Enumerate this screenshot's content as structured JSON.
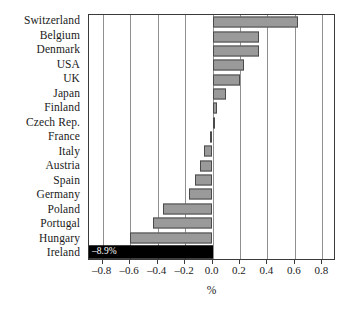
{
  "chart_data": {
    "type": "bar",
    "orientation": "horizontal",
    "title": "",
    "xlabel": "%",
    "ylabel": "",
    "xlim": [
      -0.9,
      0.9
    ],
    "xticks": [
      -0.8,
      -0.6,
      -0.4,
      -0.2,
      0.0,
      0.2,
      0.4,
      0.6,
      0.8
    ],
    "xticklabels": [
      "–0.8",
      "–0.6",
      "–0.4",
      "–0.2",
      "0.0",
      "0.2",
      "0.4",
      "0.6",
      "0.8"
    ],
    "grid": true,
    "grid_axis": "x",
    "legend": null,
    "categories": [
      "Switzerland",
      "Belgium",
      "Denmark",
      "USA",
      "UK",
      "Japan",
      "Finland",
      "Czech Rep.",
      "France",
      "Italy",
      "Austria",
      "Spain",
      "Germany",
      "Poland",
      "Portugal",
      "Hungary",
      "Ireland"
    ],
    "values": [
      0.62,
      0.34,
      0.34,
      0.23,
      0.2,
      0.1,
      0.03,
      0.0,
      -0.02,
      -0.06,
      -0.09,
      -0.13,
      -0.17,
      -0.36,
      -0.43,
      -0.6,
      -8.9
    ],
    "annotations": [
      {
        "category": "Ireland",
        "label": "–8.9%",
        "inside_bar": true
      }
    ],
    "colors": {
      "bar_fill": "#9a9a9a",
      "bar_edge": "#4a4a4a",
      "highlight_fill": "#000000",
      "highlight_label": "#ffffff",
      "gridline": "#8f8f8f",
      "axis": "#3a3a3a",
      "background": "#ffffff"
    },
    "notes": {
      "clipped_bar": "Ireland (–8.9%) extends beyond the axis range and is drawn full-width in black"
    }
  }
}
